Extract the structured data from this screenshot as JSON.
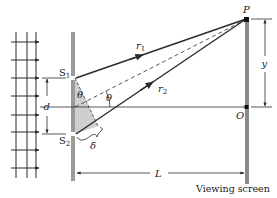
{
  "figure": {
    "labels": {
      "slit1": "S",
      "slit1_sub": "1",
      "slit2": "S",
      "slit2_sub": "2",
      "point_p": "P",
      "point_o": "O",
      "ray1": "r",
      "ray1_sub": "1",
      "ray2": "r",
      "ray2_sub": "2",
      "theta_at_slit": "θ",
      "theta_at_center": "θ",
      "path_difference": "δ",
      "slit_separation": "d",
      "screen_offset": "y",
      "distance": "L",
      "screen_caption": "Viewing screen"
    },
    "colors": {
      "line": "#2b2b2b",
      "barrier": "#9a9a9a",
      "screen": "#8a8a8a",
      "shade": "#cfcfcf",
      "background": "#ffffff"
    },
    "wave_arrow_rows": [
      42,
      60,
      78,
      96,
      115,
      132,
      150,
      168
    ]
  }
}
